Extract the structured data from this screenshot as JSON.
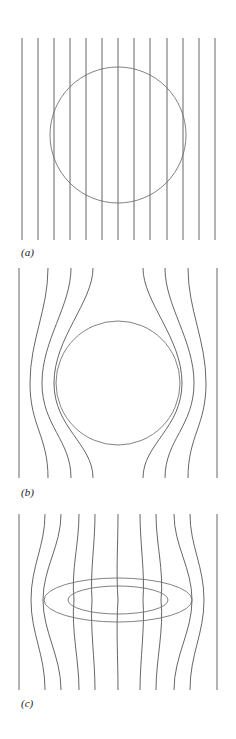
{
  "figure": {
    "type": "scientific-diagram",
    "background_color": "#ffffff",
    "line_color": "#4a4a4a",
    "outline_color": "#6b6b6b",
    "width": 236,
    "height": 739
  },
  "panels": [
    {
      "id": "a",
      "label": "(a)",
      "description": "uniform vertical field lines passing undisturbed through a circular body",
      "body_shape": "circle",
      "body": {
        "cx": 118,
        "cy": 135,
        "r": 68
      },
      "field_region": {
        "x_left": 22,
        "x_right": 215,
        "y_top": 38,
        "y_bottom": 240
      },
      "line_count": 13,
      "line_x_positions": [
        22,
        38,
        54,
        70,
        86,
        102,
        118,
        134,
        150,
        167,
        183,
        199,
        215
      ],
      "deflection": "none"
    },
    {
      "id": "b",
      "label": "(b)",
      "description": "field lines excluded from and deflected around a circular body",
      "body_shape": "circle",
      "body": {
        "cx": 118,
        "cy": 383,
        "r": 62
      },
      "field_region": {
        "x_left": 19,
        "x_right": 217,
        "y_top": 268,
        "y_bottom": 478
      },
      "line_count": 9,
      "line_x_positions": [
        19,
        48,
        71,
        93,
        143,
        165,
        188,
        217
      ],
      "deflection": "outward-exclusion"
    },
    {
      "id": "c",
      "label": "(c)",
      "description": "field lines converging and concentrated through a flattened elliptical body",
      "body_shape": "ellipse",
      "body_outer": {
        "cx": 118,
        "cy": 600,
        "rx": 74,
        "ry": 22
      },
      "body_inner": {
        "cx": 118,
        "cy": 600,
        "rx": 50,
        "ry": 14
      },
      "field_region": {
        "x_left": 19,
        "x_right": 217,
        "y_top": 514,
        "y_bottom": 690
      },
      "line_count": 11,
      "line_x_positions": [
        19,
        45,
        61,
        79,
        95,
        140,
        156,
        174,
        190,
        217
      ],
      "deflection": "inward-concentration"
    }
  ],
  "chart_data": {
    "type": "line",
    "title": "",
    "xlabel": "",
    "ylabel": "",
    "series": [
      {
        "name": "panel-a-field-lines",
        "values": [
          22,
          38,
          54,
          70,
          86,
          102,
          118,
          134,
          150,
          167,
          183,
          199,
          215
        ]
      },
      {
        "name": "panel-b-field-lines",
        "values": [
          19,
          48,
          71,
          93,
          143,
          165,
          188,
          217
        ]
      },
      {
        "name": "panel-c-field-lines",
        "values": [
          19,
          45,
          61,
          79,
          95,
          140,
          156,
          174,
          190,
          217
        ]
      }
    ]
  }
}
